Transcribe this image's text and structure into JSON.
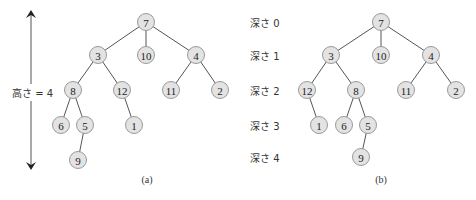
{
  "figure": {
    "panel_a": {
      "caption": "(a)",
      "height_label": "高さ = 4",
      "nodes": [
        {
          "id": "a7",
          "value": "7",
          "x": 146,
          "y": 22
        },
        {
          "id": "a3",
          "value": "3",
          "x": 98,
          "y": 55
        },
        {
          "id": "a10",
          "value": "10",
          "x": 146,
          "y": 55
        },
        {
          "id": "a4",
          "value": "4",
          "x": 196,
          "y": 55
        },
        {
          "id": "a8",
          "value": "8",
          "x": 73,
          "y": 90
        },
        {
          "id": "a12",
          "value": "12",
          "x": 122,
          "y": 90
        },
        {
          "id": "a11",
          "value": "11",
          "x": 171,
          "y": 90
        },
        {
          "id": "a2",
          "value": "2",
          "x": 220,
          "y": 90
        },
        {
          "id": "a6",
          "value": "6",
          "x": 61,
          "y": 125
        },
        {
          "id": "a5",
          "value": "5",
          "x": 85,
          "y": 125
        },
        {
          "id": "a1",
          "value": "1",
          "x": 134,
          "y": 125
        },
        {
          "id": "a9",
          "value": "9",
          "x": 78,
          "y": 160
        }
      ],
      "edges": [
        [
          "a7",
          "a3"
        ],
        [
          "a7",
          "a10"
        ],
        [
          "a7",
          "a4"
        ],
        [
          "a3",
          "a8"
        ],
        [
          "a3",
          "a12"
        ],
        [
          "a4",
          "a11"
        ],
        [
          "a4",
          "a2"
        ],
        [
          "a8",
          "a6"
        ],
        [
          "a8",
          "a5"
        ],
        [
          "a12",
          "a1"
        ],
        [
          "a5",
          "a9"
        ]
      ]
    },
    "panel_b": {
      "caption": "(b)",
      "depth_labels": [
        {
          "text": "深さ 0",
          "y": 22
        },
        {
          "text": "深さ 1",
          "y": 55
        },
        {
          "text": "深さ 2",
          "y": 90
        },
        {
          "text": "深さ 3",
          "y": 125
        },
        {
          "text": "深さ 4",
          "y": 157
        }
      ],
      "nodes": [
        {
          "id": "b7",
          "value": "7",
          "x": 381,
          "y": 22
        },
        {
          "id": "b3",
          "value": "3",
          "x": 331,
          "y": 55
        },
        {
          "id": "b10",
          "value": "10",
          "x": 381,
          "y": 55
        },
        {
          "id": "b4",
          "value": "4",
          "x": 431,
          "y": 55
        },
        {
          "id": "b12",
          "value": "12",
          "x": 307,
          "y": 90
        },
        {
          "id": "b8",
          "value": "8",
          "x": 356,
          "y": 90
        },
        {
          "id": "b11",
          "value": "11",
          "x": 406,
          "y": 90
        },
        {
          "id": "b2",
          "value": "2",
          "x": 456,
          "y": 90
        },
        {
          "id": "b1",
          "value": "1",
          "x": 319,
          "y": 125
        },
        {
          "id": "b6",
          "value": "6",
          "x": 344,
          "y": 125
        },
        {
          "id": "b5",
          "value": "5",
          "x": 368,
          "y": 125
        },
        {
          "id": "b9",
          "value": "9",
          "x": 361,
          "y": 157
        }
      ],
      "edges": [
        [
          "b7",
          "b3"
        ],
        [
          "b7",
          "b10"
        ],
        [
          "b7",
          "b4"
        ],
        [
          "b3",
          "b12"
        ],
        [
          "b3",
          "b8"
        ],
        [
          "b4",
          "b11"
        ],
        [
          "b4",
          "b2"
        ],
        [
          "b12",
          "b1"
        ],
        [
          "b8",
          "b6"
        ],
        [
          "b8",
          "b5"
        ],
        [
          "b5",
          "b9"
        ]
      ]
    }
  }
}
